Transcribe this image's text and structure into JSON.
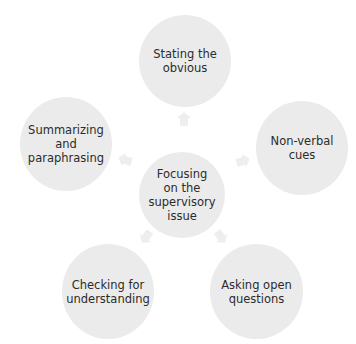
{
  "diagram": {
    "type": "radial-cycle",
    "center": {
      "label": "Focusing\non the\nsupervisory\nissue"
    },
    "nodes": [
      {
        "id": "top",
        "label": "Stating the\nobvious"
      },
      {
        "id": "right",
        "label": "Non-verbal\ncues"
      },
      {
        "id": "bottom-right",
        "label": "Asking open\nquestions"
      },
      {
        "id": "bottom-left",
        "label": "Checking for\nunderstanding"
      },
      {
        "id": "left",
        "label": "Summarizing\nand\nparaphrasing"
      }
    ],
    "colors": {
      "circle": "#ebebeb",
      "arrow": "#efefef",
      "text": "#2b2b2b",
      "background": "#ffffff"
    }
  }
}
